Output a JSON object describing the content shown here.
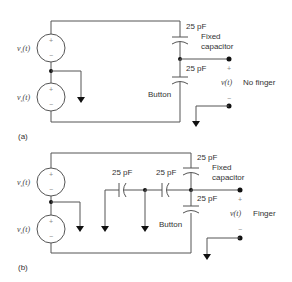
{
  "figure": {
    "panels": [
      {
        "id": "a",
        "label": "(a)",
        "sources": [
          {
            "label": "v",
            "sub": "s",
            "arg": "(t)",
            "plus": "+",
            "minus": "−"
          },
          {
            "label": "v",
            "sub": "s",
            "arg": "(t)",
            "plus": "+",
            "minus": "−"
          }
        ],
        "capacitors": [
          {
            "value": "25 pF",
            "role": "Fixed capacitor"
          },
          {
            "value": "25 pF",
            "role": "Button"
          }
        ],
        "fixed_label_line1": "Fixed",
        "fixed_label_line2": "capacitor",
        "button_label": "Button",
        "output": {
          "label": "v(t)",
          "plus": "+",
          "minus": "−",
          "state": "No finger"
        }
      },
      {
        "id": "b",
        "label": "(b)",
        "sources": [
          {
            "label": "v",
            "sub": "s",
            "arg": "(t)",
            "plus": "+",
            "minus": "−"
          },
          {
            "label": "v",
            "sub": "s",
            "arg": "(t)",
            "plus": "+",
            "minus": "−"
          }
        ],
        "capacitors": [
          {
            "value": "25 pF",
            "role": "Fixed capacitor"
          },
          {
            "value": "25 pF",
            "role": "Button"
          },
          {
            "value": "25 pF",
            "role": "Finger series 1"
          },
          {
            "value": "25 pF",
            "role": "Finger series 2"
          }
        ],
        "fixed_label_line1": "Fixed",
        "fixed_label_line2": "capacitor",
        "button_label": "Button",
        "output": {
          "label": "v(t)",
          "plus": "+",
          "minus": "−",
          "state": "Finger"
        }
      }
    ],
    "colors": {
      "wire": "#555555",
      "node": "#111111",
      "text": "#333333"
    }
  }
}
